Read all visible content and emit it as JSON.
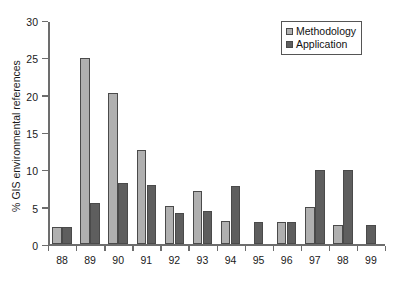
{
  "chart_data": {
    "type": "bar",
    "title": "",
    "xlabel": "",
    "ylabel": "% GIS environmental references",
    "categories": [
      "88",
      "89",
      "90",
      "91",
      "92",
      "93",
      "94",
      "95",
      "96",
      "97",
      "98",
      "99"
    ],
    "series": [
      {
        "name": "Methodology",
        "color": "#b0b0b0",
        "values": [
          2.3,
          25.0,
          20.3,
          12.7,
          5.1,
          7.2,
          3.1,
          0,
          3.0,
          5.0,
          2.6,
          0
        ]
      },
      {
        "name": "Application",
        "color": "#5e5e5e",
        "values": [
          2.3,
          5.6,
          8.2,
          7.9,
          4.2,
          4.5,
          7.8,
          3.0,
          3.0,
          10.0,
          10.0,
          2.6
        ]
      }
    ],
    "ylim": [
      0,
      30
    ],
    "yticks": [
      0,
      5,
      10,
      15,
      20,
      25,
      30
    ],
    "ytick_labels": [
      "0",
      "5",
      "10",
      "15",
      "20",
      "25",
      "30"
    ],
    "grid": false,
    "legend_position": "top-right"
  },
  "legend": {
    "items": [
      {
        "label": "Methodology",
        "swatch": "methodology-swatch"
      },
      {
        "label": "Application",
        "swatch": "application-swatch"
      }
    ]
  },
  "axes": {
    "y_title": "% GIS environmental references"
  }
}
